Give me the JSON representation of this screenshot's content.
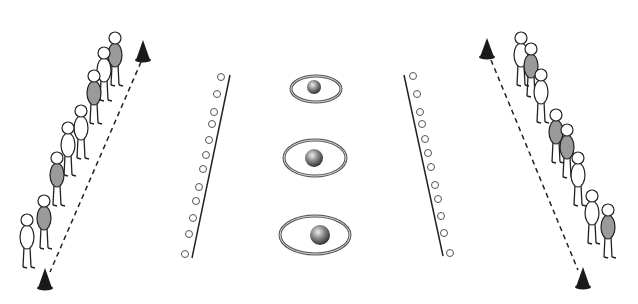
{
  "diagram": {
    "colors": {
      "background": "#ffffff",
      "line": "#222222",
      "cone": "#1a1a1a",
      "body_grey": "#9a9a9a",
      "body_white": "#ffffff",
      "ball": "#777777",
      "marker": "#555555"
    },
    "left_team": {
      "players": 8,
      "cone_top": [
        143,
        52
      ],
      "cone_bottom": [
        45,
        284
      ]
    },
    "right_team": {
      "players": 8,
      "cone_top": [
        487,
        50
      ],
      "cone_bottom": [
        583,
        283
      ]
    },
    "left_markers": 12,
    "right_markers": 12,
    "targets": [
      {
        "cx": 316,
        "cy": 89,
        "rx": 25,
        "ry": 13,
        "ball_r": 7
      },
      {
        "cx": 315,
        "cy": 158,
        "rx": 31,
        "ry": 18,
        "ball_r": 9
      },
      {
        "cx": 315,
        "cy": 235,
        "rx": 35,
        "ry": 19,
        "ball_r": 10
      }
    ]
  }
}
